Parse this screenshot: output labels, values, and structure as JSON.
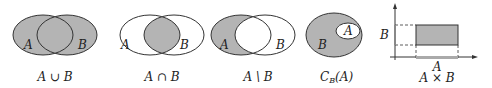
{
  "figures": [
    {
      "id": "union",
      "caption": "A ∪ B",
      "set_a": "A",
      "set_b": "B"
    },
    {
      "id": "intersection",
      "caption": "A ∩ B",
      "set_a": "A",
      "set_b": "B"
    },
    {
      "id": "difference",
      "caption": "A \\ B",
      "set_a": "A",
      "set_b": "B"
    },
    {
      "id": "complement",
      "caption_main": "C",
      "caption_sub": "B",
      "caption_arg": "(A)",
      "outer": "B",
      "inner": "A"
    },
    {
      "id": "cartesian",
      "caption": "A × B",
      "x_label": "A",
      "y_label": "B"
    }
  ],
  "colors": {
    "shade": "#b4b4b4",
    "stroke": "#333333",
    "background": "#ffffff"
  }
}
